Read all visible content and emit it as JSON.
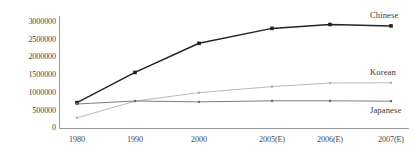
{
  "chart_data": {
    "type": "line",
    "title": "",
    "subtitle": "",
    "xlabel": "",
    "ylabel": "",
    "grid": false,
    "legend_position": "inline-right-of-line-end",
    "categories": [
      "1980",
      "1990",
      "2000",
      "2005(E)",
      "2006(E)",
      "2007(E)"
    ],
    "ylim": [
      0,
      3000000
    ],
    "y_ticks": [
      0,
      500000,
      1000000,
      1500000,
      2000000,
      2500000,
      3000000
    ],
    "y_tick_labels": [
      "0",
      "500000",
      "1000000",
      "1500000",
      "2000000",
      "2500000",
      "3000000"
    ],
    "series": [
      {
        "name": "Chinese",
        "color": "#232323",
        "marker": "square",
        "values": [
          730000,
          1580000,
          2400000,
          2820000,
          2930000,
          2890000
        ]
      },
      {
        "name": "Korean",
        "color": "#b0b0b0",
        "marker": "square",
        "values": [
          300000,
          770000,
          1010000,
          1180000,
          1280000,
          1290000
        ]
      },
      {
        "name": "Japanese",
        "color": "#6e6e6e",
        "marker": "square",
        "values": [
          690000,
          775000,
          750000,
          780000,
          780000,
          770000
        ]
      }
    ]
  },
  "axis": {
    "y_axis_name": "y-axis-line",
    "x_axis_name": "x-axis-line"
  }
}
